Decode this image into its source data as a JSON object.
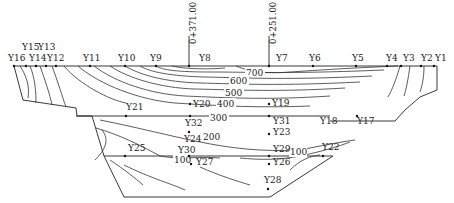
{
  "diagram": {
    "type": "cross-section contour diagram",
    "chainage_markers": [
      {
        "id": "m1",
        "label": "0+371.00",
        "x": 189
      },
      {
        "id": "m2",
        "label": "0+251.00",
        "x": 269
      }
    ],
    "surface_points": [
      {
        "label": "Y16",
        "x": 14
      },
      {
        "label": "Y15",
        "x": 26
      },
      {
        "label": "Y14",
        "x": 36
      },
      {
        "label": "Y13",
        "x": 46
      },
      {
        "label": "Y12",
        "x": 56
      },
      {
        "label": "Y11",
        "x": 90
      },
      {
        "label": "Y10",
        "x": 125
      },
      {
        "label": "Y9",
        "x": 156
      },
      {
        "label": "Y8",
        "x": 189
      },
      {
        "label": "Y7",
        "x": 269
      },
      {
        "label": "Y6",
        "x": 313
      },
      {
        "label": "Y5",
        "x": 356
      },
      {
        "label": "Y4",
        "x": 387
      },
      {
        "label": "Y3",
        "x": 401
      },
      {
        "label": "Y2",
        "x": 421
      },
      {
        "label": "Y1",
        "x": 434
      }
    ],
    "interior_points": [
      {
        "label": "Y21"
      },
      {
        "label": "Y20"
      },
      {
        "label": "Y19"
      },
      {
        "label": "Y32"
      },
      {
        "label": "Y31"
      },
      {
        "label": "Y18"
      },
      {
        "label": "Y17"
      },
      {
        "label": "Y23"
      },
      {
        "label": "Y24"
      },
      {
        "label": "Y30"
      },
      {
        "label": "Y29"
      },
      {
        "label": "Y25"
      },
      {
        "label": "Y22"
      },
      {
        "label": "Y27"
      },
      {
        "label": "Y26"
      },
      {
        "label": "Y28"
      }
    ],
    "contour_labels": [
      "700",
      "600",
      "500",
      "400",
      "300",
      "200",
      "100",
      "100"
    ]
  }
}
